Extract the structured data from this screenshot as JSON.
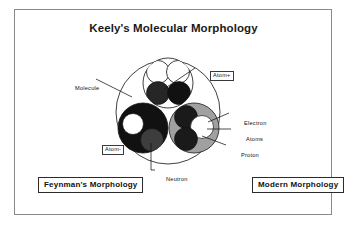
{
  "figure": {
    "title": "Keely's Molecular Morphology"
  },
  "labels": {
    "molecule": "Molecule",
    "atom_plus": "Atom+",
    "electron": "Electron",
    "atoms": "Atoms",
    "proton": "Proton",
    "atom_minus": "Atom-",
    "neutron": "Neutron"
  },
  "captions": {
    "left": "Feynman's Morphology",
    "right": "Modern Morphology"
  },
  "colors": {
    "frame": "#8a8a8a",
    "ink": "#111111",
    "dark_sphere": "#1c1c1c",
    "mid_sphere": "#3a3a3a",
    "gray_sphere": "#9a9a9a",
    "light_sphere": "#d8d8d8",
    "white_sphere": "#ffffff",
    "background": "#ffffff"
  },
  "diagram": {
    "type": "molecular-morphology-schematic",
    "outer_circle": {
      "name": "molecule-boundary",
      "cx": 168,
      "cy": 112,
      "r": 52
    },
    "atoms": [
      {
        "name": "atom-plus-top",
        "cx": 168,
        "cy": 83,
        "r": 25,
        "fill": "white",
        "particles": [
          {
            "name": "electron",
            "cx": 158,
            "cy": 72,
            "r": 11,
            "fill": "white"
          },
          {
            "name": "electron",
            "cx": 178,
            "cy": 72,
            "r": 11,
            "fill": "white"
          },
          {
            "name": "proton",
            "cx": 158,
            "cy": 92,
            "r": 11,
            "fill": "dark"
          },
          {
            "name": "neutron",
            "cx": 178,
            "cy": 92,
            "r": 11,
            "fill": "dark"
          }
        ]
      },
      {
        "name": "atom-minus-lower-left",
        "cx": 143,
        "cy": 128,
        "r": 25,
        "fill": "dark",
        "particles": [
          {
            "name": "electron",
            "cx": 133,
            "cy": 124,
            "r": 10,
            "fill": "white"
          },
          {
            "name": "neutron",
            "cx": 152,
            "cy": 140,
            "r": 11,
            "fill": "mid"
          }
        ]
      },
      {
        "name": "atom-lower-right",
        "cx": 194,
        "cy": 128,
        "r": 25,
        "fill": "gray",
        "particles": [
          {
            "name": "proton",
            "cx": 186,
            "cy": 117,
            "r": 11,
            "fill": "dark"
          },
          {
            "name": "electron",
            "cx": 201,
            "cy": 127,
            "r": 11,
            "fill": "white"
          },
          {
            "name": "neutron",
            "cx": 186,
            "cy": 139,
            "r": 11,
            "fill": "dark"
          }
        ]
      }
    ],
    "leader_lines": [
      {
        "name": "leader-molecule",
        "from": [
          96,
          80
        ],
        "to": [
          135,
          97
        ]
      },
      {
        "name": "leader-atom-plus",
        "from": [
          195,
          68
        ],
        "to": [
          160,
          90
        ]
      },
      {
        "name": "leader-electron",
        "from": [
          229,
          113
        ],
        "to": [
          207,
          122
        ]
      },
      {
        "name": "leader-atoms",
        "from": [
          231,
          129
        ],
        "to": [
          207,
          129
        ]
      },
      {
        "name": "leader-proton",
        "from": [
          226,
          145
        ],
        "to": [
          202,
          136
        ]
      },
      {
        "name": "leader-atom-minus",
        "from": [
          121,
          139
        ],
        "to": [
          142,
          133
        ]
      },
      {
        "name": "leader-neutron",
        "from": [
          151,
          170
        ],
        "to": [
          151,
          143
        ]
      }
    ]
  }
}
